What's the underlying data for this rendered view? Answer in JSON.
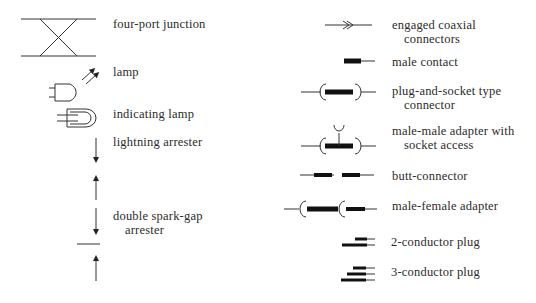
{
  "left_column": [
    {
      "id": "four-port-junction",
      "label": "four-port junction"
    },
    {
      "id": "lamp",
      "label": "lamp"
    },
    {
      "id": "indicating-lamp",
      "label": "indicating lamp"
    },
    {
      "id": "lightning-arrester",
      "label": "lightning arrester"
    },
    {
      "id": "double-spark-gap-arrester",
      "label_line1": "double spark-gap",
      "label_line2": "arrester"
    }
  ],
  "right_column": [
    {
      "id": "engaged-coaxial-connectors",
      "label_line1": "engaged coaxial",
      "label_line2": "connectors"
    },
    {
      "id": "male-contact",
      "label": "male contact"
    },
    {
      "id": "plug-and-socket-connector",
      "label_line1": "plug-and-socket type",
      "label_line2": "connector"
    },
    {
      "id": "male-male-adapter",
      "label_line1": "male-male adapter with",
      "label_line2": "socket access"
    },
    {
      "id": "butt-connector",
      "label": "butt-connector"
    },
    {
      "id": "male-female-adapter",
      "label": "male-female adapter"
    },
    {
      "id": "two-conductor-plug",
      "label": "2-conductor plug"
    },
    {
      "id": "three-conductor-plug",
      "label": "3-conductor plug"
    }
  ],
  "colors": {
    "ink": "#222222",
    "background": "#ffffff"
  }
}
